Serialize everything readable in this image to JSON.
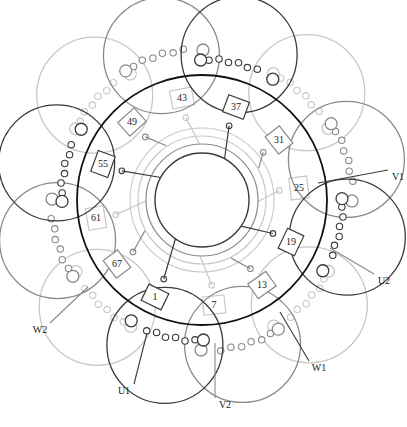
{
  "diagram": {
    "type": "stator-winding-diagram",
    "center": [
      202,
      200
    ],
    "colors": {
      "dark": "#3a3a3a",
      "medium": "#8a8a8a",
      "light": "#c8c8c8",
      "main_ring": "#111111"
    },
    "slot_labels": [
      {
        "text": "1",
        "x": 155,
        "y": 297
      },
      {
        "text": "7",
        "x": 214,
        "y": 305
      },
      {
        "text": "13",
        "x": 262,
        "y": 285
      },
      {
        "text": "19",
        "x": 291,
        "y": 242
      },
      {
        "text": "25",
        "x": 299,
        "y": 188
      },
      {
        "text": "31",
        "x": 279,
        "y": 140
      },
      {
        "text": "37",
        "x": 236,
        "y": 107
      },
      {
        "text": "43",
        "x": 182,
        "y": 98
      },
      {
        "text": "49",
        "x": 132,
        "y": 122
      },
      {
        "text": "55",
        "x": 103,
        "y": 164
      },
      {
        "text": "61",
        "x": 96,
        "y": 218
      },
      {
        "text": "67",
        "x": 117,
        "y": 264
      }
    ],
    "terminals": [
      {
        "text": "V1",
        "x": 398,
        "y": 178
      },
      {
        "text": "U2",
        "x": 384,
        "y": 282
      },
      {
        "text": "W1",
        "x": 319,
        "y": 369
      },
      {
        "text": "V2",
        "x": 225,
        "y": 406
      },
      {
        "text": "U1",
        "x": 124,
        "y": 392
      },
      {
        "text": "W2",
        "x": 40,
        "y": 331
      }
    ]
  }
}
